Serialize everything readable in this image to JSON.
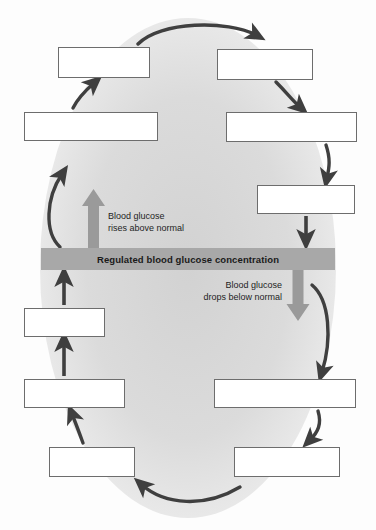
{
  "diagram": {
    "center_bar": {
      "label": "Regulated blood glucose concentration",
      "color": "#a8a8a8"
    },
    "flow_labels": [
      {
        "name": "rise-label",
        "line1": "Blood glucose",
        "line2": "rises above normal",
        "arrow_direction": "up",
        "arrow_color": "#9a9a9a"
      },
      {
        "name": "drop-label",
        "line1": "Blood glucose",
        "line2": "drops below normal",
        "arrow_direction": "down",
        "arrow_color": "#9a9a9a"
      }
    ],
    "boxes": [
      {
        "name": "box-top-left",
        "label": "",
        "x": 58,
        "y": 47,
        "w": 92,
        "h": 31
      },
      {
        "name": "box-top-right",
        "label": "",
        "x": 217,
        "y": 49,
        "w": 96,
        "h": 31
      },
      {
        "name": "box-left-upper",
        "label": "",
        "x": 24,
        "y": 112,
        "w": 134,
        "h": 29
      },
      {
        "name": "box-right-upper",
        "label": "",
        "x": 226,
        "y": 112,
        "w": 131,
        "h": 30
      },
      {
        "name": "box-right-mid",
        "label": "",
        "x": 257,
        "y": 185,
        "w": 98,
        "h": 29
      },
      {
        "name": "box-left-lower-first",
        "label": "",
        "x": 24,
        "y": 308,
        "w": 81,
        "h": 29
      },
      {
        "name": "box-left-lower-second",
        "label": "",
        "x": 24,
        "y": 379,
        "w": 101,
        "h": 29
      },
      {
        "name": "box-left-bottom",
        "label": "",
        "x": 49,
        "y": 447,
        "w": 86,
        "h": 30
      },
      {
        "name": "box-right-lower",
        "label": "",
        "x": 214,
        "y": 379,
        "w": 142,
        "h": 29
      },
      {
        "name": "box-right-bottom",
        "label": "",
        "x": 234,
        "y": 447,
        "w": 106,
        "h": 30
      }
    ],
    "colors": {
      "box_border": "#6d6d6d",
      "box_fill": "#ffffff",
      "arrow_dark": "#3f3f3f",
      "backdrop": "#dedede",
      "page_background": "#fdfdfd"
    },
    "arrows": [
      {
        "name": "arrow-top-left-to-top-right",
        "style": "dark-curve"
      },
      {
        "name": "arrow-top-right-to-right-upper",
        "style": "dark-curve"
      },
      {
        "name": "arrow-right-upper-to-right-mid",
        "style": "dark-curve"
      },
      {
        "name": "arrow-right-mid-to-center-bar",
        "style": "dark-straight"
      },
      {
        "name": "arrow-center-bar-drop",
        "style": "gray-block-down"
      },
      {
        "name": "arrow-drop-to-right-lower",
        "style": "dark-curve"
      },
      {
        "name": "arrow-right-lower-to-right-bottom",
        "style": "dark-curve"
      },
      {
        "name": "arrow-right-bottom-to-left-bottom",
        "style": "dark-curve"
      },
      {
        "name": "arrow-left-bottom-to-left-lower-second",
        "style": "dark-curve"
      },
      {
        "name": "arrow-left-lower-second-to-left-lower-first",
        "style": "dark-straight"
      },
      {
        "name": "arrow-left-lower-first-to-center-bar",
        "style": "dark-straight"
      },
      {
        "name": "arrow-center-bar-rise",
        "style": "gray-block-up"
      },
      {
        "name": "arrow-rise-to-left-upper",
        "style": "dark-curve"
      },
      {
        "name": "arrow-left-upper-to-top-left",
        "style": "dark-curve"
      }
    ]
  }
}
